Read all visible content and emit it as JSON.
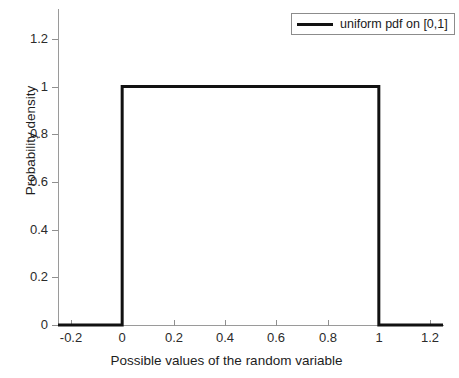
{
  "chart_data": {
    "type": "line",
    "title": "",
    "subtitle": "",
    "xlabel": "Possible values of the random variable",
    "ylabel": "Probability density",
    "xlim": [
      -0.25,
      1.25
    ],
    "ylim": [
      0,
      1.325
    ],
    "xticks": [
      -0.2,
      0,
      0.2,
      0.4,
      0.6,
      0.8,
      1,
      1.2
    ],
    "xticklabels": [
      "-0.2",
      "0",
      "0.2",
      "0.4",
      "0.6",
      "0.8",
      "1",
      "1.2"
    ],
    "yticks": [
      0,
      0.2,
      0.4,
      0.6,
      0.8,
      1,
      1.2
    ],
    "yticklabels": [
      "0",
      "0.2",
      "0.4",
      "0.6",
      "0.8",
      "1",
      "1.2"
    ],
    "grid": false,
    "legend_position": "top-right",
    "series": [
      {
        "name": "uniform pdf on [0,1]",
        "color": "#111111",
        "linewidth": 3,
        "x": [
          -0.25,
          0,
          0,
          1,
          1,
          1.25
        ],
        "values": [
          0,
          0,
          1,
          1,
          0,
          0
        ]
      }
    ],
    "annotations": []
  },
  "legend": {
    "entries": [
      {
        "label": "uniform pdf on [0,1]",
        "color": "#111111"
      }
    ]
  },
  "axes": {
    "x_title": "Possible values of the random variable",
    "y_title": "Probability density"
  },
  "colors": {
    "background": "#ffffff",
    "axis": "#9a9a9a",
    "tick_text": "#2b2b2b",
    "data_line": "#111111",
    "legend_border": "#8c8c8c"
  }
}
